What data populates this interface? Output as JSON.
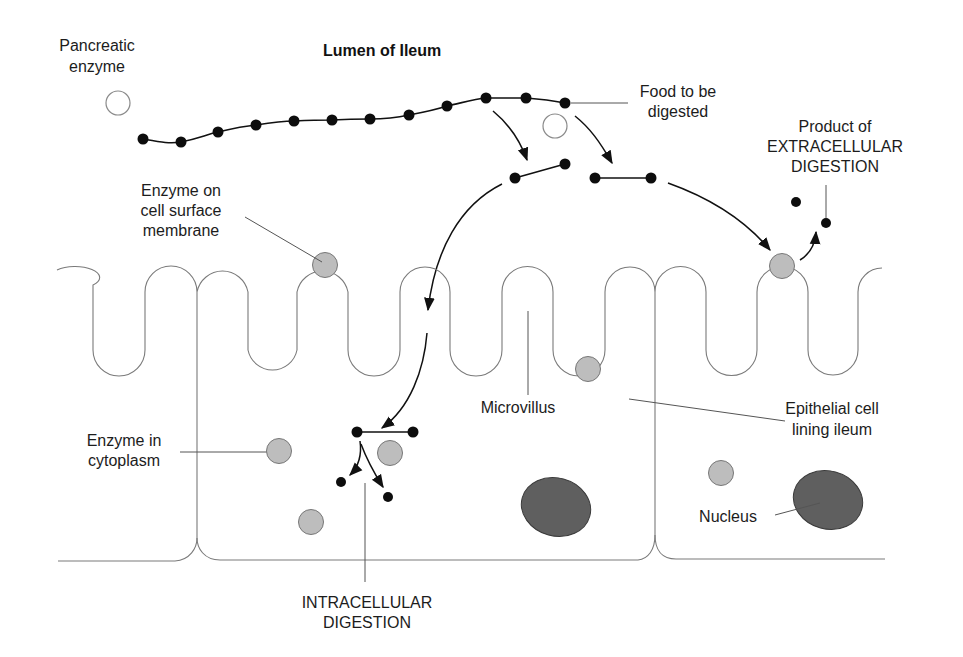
{
  "diagram": {
    "title": "Lumen of Ileum",
    "labels": {
      "pancreatic_enzyme": [
        "Pancreatic",
        "enzyme"
      ],
      "food": [
        "Food to be",
        "digested"
      ],
      "product": [
        "Product of",
        "EXTRACELLULAR",
        "DIGESTION"
      ],
      "enzyme_surface": [
        "Enzyme on",
        "cell surface",
        "membrane"
      ],
      "microvillus": "Microvillus",
      "epithelial": [
        "Epithelial cell",
        "lining ileum"
      ],
      "enzyme_cytoplasm": [
        "Enzyme in",
        "cytoplasm"
      ],
      "nucleus": "Nucleus",
      "intracellular": [
        "INTRACELLULAR",
        "DIGESTION"
      ]
    },
    "colors": {
      "enzyme_fill": "#bdbdbd",
      "nucleus_fill": "#5f5f5f",
      "molecule": "#0d0d0d",
      "membrane": "#7a7a7a"
    }
  }
}
